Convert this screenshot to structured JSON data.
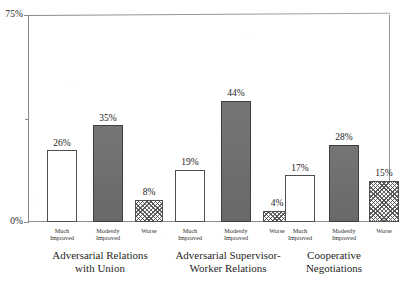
{
  "chart_data": {
    "type": "bar",
    "title": "",
    "subtitle": "",
    "xlabel": "",
    "ylabel": "",
    "ylim": [
      0,
      75
    ],
    "y_tick_labels": [
      "0%",
      "75%"
    ],
    "y_tick_values": [
      0,
      75
    ],
    "y_minor_tick_values": [
      37.5
    ],
    "grid": false,
    "legend": "none",
    "value_suffix": "%",
    "categories": [
      "Much Improved",
      "Modestly Improved",
      "Worse"
    ],
    "groups": [
      {
        "name": "Adversarial Relations with Union",
        "title_lines": [
          "Adversarial Relations",
          "with Union"
        ],
        "bars": [
          {
            "category": "Much Improved",
            "category_lines": [
              "Much",
              "Improved"
            ],
            "value": 26,
            "label": "26%",
            "fill": "open"
          },
          {
            "category": "Modestly Improved",
            "category_lines": [
              "Modestly",
              "Improved"
            ],
            "value": 35,
            "label": "35%",
            "fill": "solid"
          },
          {
            "category": "Worse",
            "category_lines": [
              "Worse"
            ],
            "value": 8,
            "label": "8%",
            "fill": "hatch"
          }
        ]
      },
      {
        "name": "Adversarial Supervisor-Worker Relations",
        "title_lines": [
          "Adversarial Supervisor-",
          "Worker Relations"
        ],
        "bars": [
          {
            "category": "Much Improved",
            "category_lines": [
              "Much",
              "Improved"
            ],
            "value": 19,
            "label": "19%",
            "fill": "open"
          },
          {
            "category": "Modestly Improved",
            "category_lines": [
              "Modestly",
              "Improved"
            ],
            "value": 44,
            "label": "44%",
            "fill": "solid"
          },
          {
            "category": "Worse",
            "category_lines": [
              "Worse"
            ],
            "value": 4,
            "label": "4%",
            "fill": "hatch"
          }
        ]
      },
      {
        "name": "Cooperative Negotiations",
        "title_lines": [
          "Cooperative",
          "Negotiations"
        ],
        "bars": [
          {
            "category": "Much Improved",
            "category_lines": [
              "Much",
              "Improved"
            ],
            "value": 17,
            "label": "17%",
            "fill": "open"
          },
          {
            "category": "Modestly Improved",
            "category_lines": [
              "Modestly",
              "Improved"
            ],
            "value": 28,
            "label": "28%",
            "fill": "solid"
          },
          {
            "category": "Worse",
            "category_lines": [
              "Worse"
            ],
            "value": 15,
            "label": "15%",
            "fill": "hatch"
          }
        ]
      }
    ],
    "series": [
      {
        "name": "Much Improved",
        "values": [
          26,
          19,
          17
        ]
      },
      {
        "name": "Modestly Improved",
        "values": [
          35,
          44,
          28
        ]
      },
      {
        "name": "Worse",
        "values": [
          8,
          4,
          15
        ]
      }
    ],
    "colors": {
      "open_fill": "#ffffff",
      "solid_fill": "#6e6e6e",
      "hatch_fill": "#ffffff",
      "hatch_line": "#464646",
      "bar_outline": "#4f4f4f",
      "axis": "#8d8d8d",
      "text": "#242424",
      "background": "#ffffff"
    }
  }
}
